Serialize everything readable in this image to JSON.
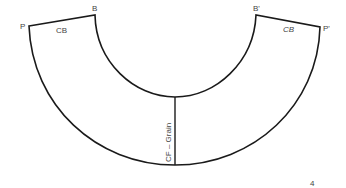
{
  "diagram": {
    "type": "sewing-pattern-piece",
    "points": {
      "P": "P",
      "B": "B",
      "B_prime": "B'",
      "P_prime": "P'"
    },
    "edge_labels": {
      "left_top": "CB",
      "right_top": "CB"
    },
    "center_line_label": "CF – Grain",
    "page_number": "4",
    "colors": {
      "line": "#1a1a1a",
      "text": "#444444",
      "background": "#ffffff"
    }
  }
}
